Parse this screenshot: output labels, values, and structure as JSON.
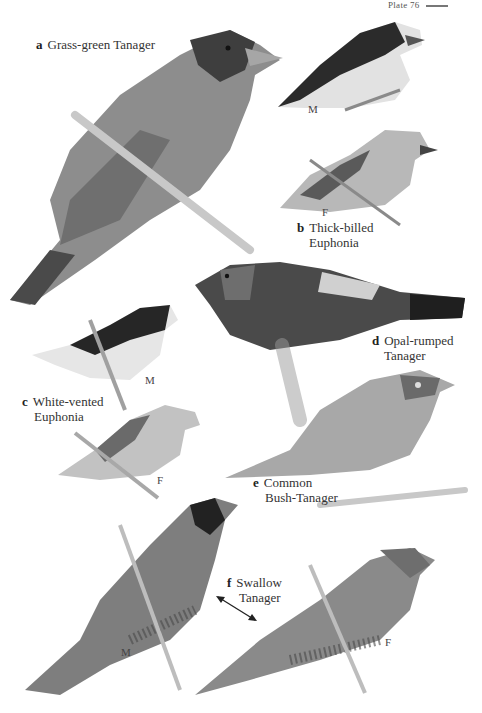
{
  "plate": {
    "header": "Plate 76",
    "species": [
      {
        "letter": "a",
        "name_line1": "Grass-green Tanager",
        "name_line2": ""
      },
      {
        "letter": "b",
        "name_line1": "Thick-billed",
        "name_line2": "Euphonia",
        "sexes": [
          "M",
          "F"
        ]
      },
      {
        "letter": "c",
        "name_line1": "White-vented",
        "name_line2": "Euphonia",
        "sexes": [
          "M",
          "F"
        ]
      },
      {
        "letter": "d",
        "name_line1": "Opal-rumped",
        "name_line2": "Tanager"
      },
      {
        "letter": "e",
        "name_line1": "Common",
        "name_line2": "Bush-Tanager"
      },
      {
        "letter": "f",
        "name_line1": "Swallow",
        "name_line2": "Tanager",
        "sexes": [
          "M",
          "F"
        ]
      }
    ]
  }
}
